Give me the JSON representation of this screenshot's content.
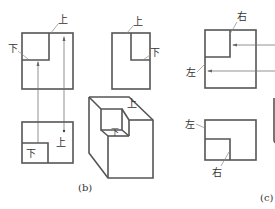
{
  "figure": {
    "panel_b": {
      "caption": "(b)",
      "top_view": {
        "label_top": "上",
        "label_bottom": "下"
      },
      "front_view": {
        "label_top": "上",
        "label_bottom": "下"
      },
      "side_view": {
        "label_top": "上",
        "label_bottom": "下"
      },
      "iso_view": {
        "label_top": "上",
        "label_bottom": "下"
      }
    },
    "panel_c": {
      "caption": "(c)",
      "top_view": {
        "label_right": "右",
        "label_left": "左"
      },
      "front_view": {
        "label_left": "左",
        "label_right": "右"
      }
    }
  }
}
